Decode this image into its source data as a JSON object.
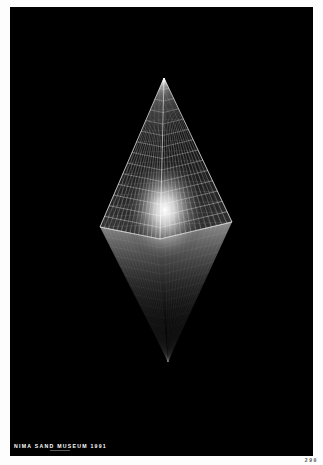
{
  "poster": {
    "background": "#000000",
    "caption": "NIMA SAND MUSEUM 1991",
    "caption_color": "#ffffff",
    "artwork": {
      "subject": "glowing wireframe glass pyramid with inverted reflection",
      "apex": [
        154,
        71
      ],
      "base_left": [
        90,
        220
      ],
      "base_right": [
        222,
        215
      ],
      "base_front": [
        150,
        232
      ],
      "reflection_tip": [
        158,
        355
      ],
      "glow_center": [
        155,
        203
      ],
      "line_color": "#ffffff",
      "grid_rows": 14,
      "grid_cols": 14
    }
  },
  "page": {
    "number": "299",
    "background": "#fdfdfd"
  }
}
